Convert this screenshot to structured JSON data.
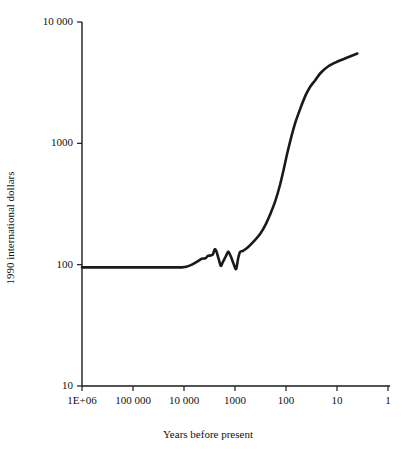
{
  "chart_data": {
    "type": "line",
    "title": "",
    "xlabel": "Years before present",
    "ylabel": "1990 international dollars",
    "xscale": "log-reversed",
    "yscale": "log",
    "xlim": [
      1000000,
      1
    ],
    "ylim": [
      10,
      10000
    ],
    "grid": false,
    "legend": null,
    "xticks": [
      {
        "value": 1000000,
        "label": "1E+06"
      },
      {
        "value": 100000,
        "label": "100 000"
      },
      {
        "value": 10000,
        "label": "10 000"
      },
      {
        "value": 1000,
        "label": "1000"
      },
      {
        "value": 100,
        "label": "100"
      },
      {
        "value": 10,
        "label": "10"
      },
      {
        "value": 1,
        "label": "1"
      }
    ],
    "yticks": [
      {
        "value": 10000,
        "label": "10 000"
      },
      {
        "value": 1000,
        "label": "1000"
      },
      {
        "value": 100,
        "label": "100"
      },
      {
        "value": 10,
        "label": "10"
      }
    ],
    "series": [
      {
        "name": "GDP per capita",
        "color": "#1a1a1a",
        "points": [
          {
            "x": 1000000,
            "y": 95
          },
          {
            "x": 300000,
            "y": 95
          },
          {
            "x": 100000,
            "y": 95
          },
          {
            "x": 30000,
            "y": 95
          },
          {
            "x": 14000,
            "y": 95
          },
          {
            "x": 11000,
            "y": 95
          },
          {
            "x": 9000,
            "y": 96
          },
          {
            "x": 7000,
            "y": 100
          },
          {
            "x": 5500,
            "y": 106
          },
          {
            "x": 4500,
            "y": 112
          },
          {
            "x": 3800,
            "y": 113
          },
          {
            "x": 3400,
            "y": 118
          },
          {
            "x": 3000,
            "y": 119
          },
          {
            "x": 2700,
            "y": 122
          },
          {
            "x": 2500,
            "y": 134
          },
          {
            "x": 2300,
            "y": 128
          },
          {
            "x": 2100,
            "y": 112
          },
          {
            "x": 1900,
            "y": 98
          },
          {
            "x": 1750,
            "y": 104
          },
          {
            "x": 1500,
            "y": 118
          },
          {
            "x": 1350,
            "y": 128
          },
          {
            "x": 1200,
            "y": 116
          },
          {
            "x": 1050,
            "y": 100
          },
          {
            "x": 950,
            "y": 92
          },
          {
            "x": 870,
            "y": 112
          },
          {
            "x": 800,
            "y": 127
          },
          {
            "x": 700,
            "y": 130
          },
          {
            "x": 550,
            "y": 140
          },
          {
            "x": 420,
            "y": 157
          },
          {
            "x": 320,
            "y": 180
          },
          {
            "x": 250,
            "y": 215
          },
          {
            "x": 200,
            "y": 265
          },
          {
            "x": 160,
            "y": 340
          },
          {
            "x": 130,
            "y": 460
          },
          {
            "x": 110,
            "y": 620
          },
          {
            "x": 95,
            "y": 820
          },
          {
            "x": 80,
            "y": 1100
          },
          {
            "x": 65,
            "y": 1500
          },
          {
            "x": 52,
            "y": 1950
          },
          {
            "x": 42,
            "y": 2450
          },
          {
            "x": 34,
            "y": 2900
          },
          {
            "x": 27,
            "y": 3300
          },
          {
            "x": 21,
            "y": 3800
          },
          {
            "x": 15,
            "y": 4300
          },
          {
            "x": 10,
            "y": 4700
          },
          {
            "x": 7,
            "y": 5000
          },
          {
            "x": 5,
            "y": 5300
          },
          {
            "x": 4,
            "y": 5500
          }
        ]
      }
    ]
  }
}
